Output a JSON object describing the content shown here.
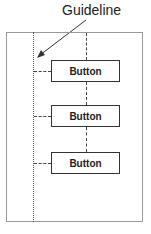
{
  "annotation": {
    "label": "Guideline"
  },
  "buttons": [
    {
      "label": "Button"
    },
    {
      "label": "Button"
    },
    {
      "label": "Button"
    }
  ],
  "colors": {
    "line": "#444444",
    "frame": "#9a9a9a",
    "text": "#222222"
  }
}
